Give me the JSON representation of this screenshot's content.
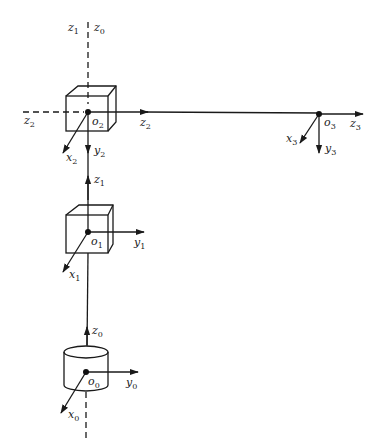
{
  "diagram": {
    "title": "",
    "colors": {
      "ink": "#1a1a1a",
      "background": "#ffffff"
    },
    "frames": [
      {
        "origin": "o0",
        "shape": "cylinder",
        "pos": [
          86,
          372
        ],
        "labels": {
          "origin": {
            "base": "o",
            "sub": "0"
          },
          "x": {
            "base": "x",
            "sub": "0"
          },
          "y": {
            "base": "y",
            "sub": "0"
          },
          "z": {
            "base": "z",
            "sub": "0"
          }
        }
      },
      {
        "origin": "o1",
        "shape": "cube",
        "pos": [
          88,
          232
        ],
        "labels": {
          "origin": {
            "base": "o",
            "sub": "1"
          },
          "x": {
            "base": "x",
            "sub": "1"
          },
          "y": {
            "base": "y",
            "sub": "1"
          },
          "z": {
            "base": "z",
            "sub": "1"
          }
        }
      },
      {
        "origin": "o2",
        "shape": "cube",
        "pos": [
          88,
          112
        ],
        "labels": {
          "origin": {
            "base": "o",
            "sub": "2"
          },
          "x": {
            "base": "x",
            "sub": "2"
          },
          "y": {
            "base": "y",
            "sub": "2"
          },
          "z": {
            "base": "z",
            "sub": "2"
          },
          "z_back": {
            "base": "z",
            "sub": "2"
          }
        }
      },
      {
        "origin": "o3",
        "shape": "point",
        "pos": [
          319,
          114
        ],
        "labels": {
          "origin": {
            "base": "o",
            "sub": "3"
          },
          "x": {
            "base": "x",
            "sub": "3"
          },
          "y": {
            "base": "y",
            "sub": "3"
          },
          "z": {
            "base": "z",
            "sub": "3"
          }
        }
      }
    ],
    "top_labels": {
      "left": {
        "base": "z",
        "sub": "1"
      },
      "right": {
        "base": "z",
        "sub": "0"
      }
    }
  }
}
